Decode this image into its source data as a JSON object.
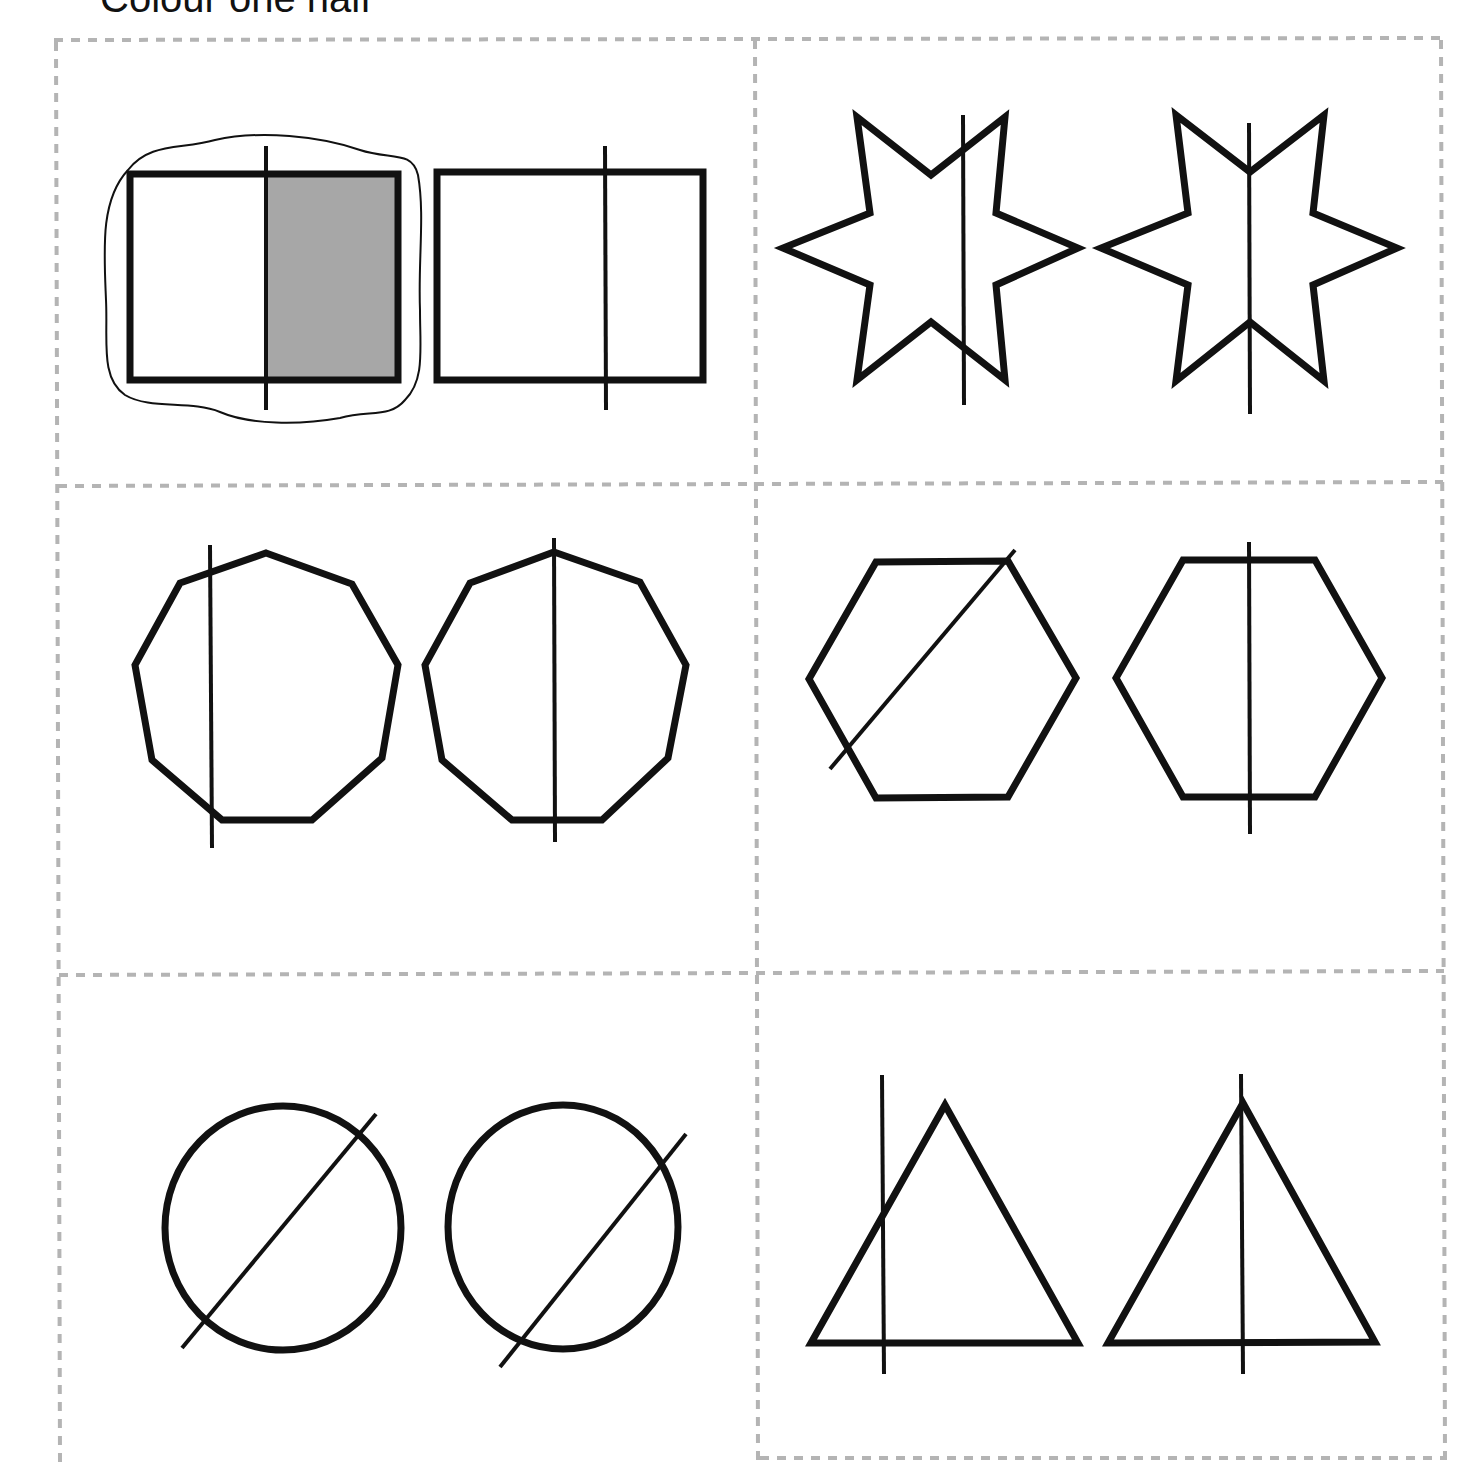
{
  "worksheet": {
    "title": "Colour one half",
    "colors": {
      "outline": "#111111",
      "shaded_half": "#a7a7a7",
      "grid_dashes": "#b4b4b4",
      "background": "#ffffff"
    },
    "cells": [
      {
        "position": "row-1-left",
        "shape": "rectangle",
        "options": [
          {
            "label": "rectangle-option-1",
            "divided_into_halves": true,
            "selected": true,
            "half_shaded": true,
            "circled": true
          },
          {
            "label": "rectangle-option-2",
            "divided_into_halves": false,
            "selected": false
          }
        ]
      },
      {
        "position": "row-1-right",
        "shape": "six-pointed-star",
        "options": [
          {
            "label": "star-option-1",
            "divided_into_halves": false
          },
          {
            "label": "star-option-2",
            "divided_into_halves": true
          }
        ]
      },
      {
        "position": "row-2-left",
        "shape": "nonagon",
        "options": [
          {
            "label": "nonagon-option-1",
            "divided_into_halves": false
          },
          {
            "label": "nonagon-option-2",
            "divided_into_halves": true
          }
        ]
      },
      {
        "position": "row-2-right",
        "shape": "hexagon",
        "options": [
          {
            "label": "hexagon-option-1",
            "divided_into_halves": false
          },
          {
            "label": "hexagon-option-2",
            "divided_into_halves": true
          }
        ]
      },
      {
        "position": "row-3-left",
        "shape": "circle",
        "options": [
          {
            "label": "circle-option-1",
            "divided_into_halves": true
          },
          {
            "label": "circle-option-2",
            "divided_into_halves": false
          }
        ]
      },
      {
        "position": "row-3-right",
        "shape": "triangle",
        "options": [
          {
            "label": "triangle-option-1",
            "divided_into_halves": false
          },
          {
            "label": "triangle-option-2",
            "divided_into_halves": true
          }
        ]
      }
    ]
  }
}
